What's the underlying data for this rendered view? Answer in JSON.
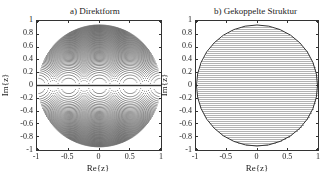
{
  "chart_data": [
    {
      "type": "scatter",
      "title": "a)  Direktform",
      "xlabel": "Re{z}",
      "ylabel": "Im{z}",
      "xlim": [
        -1,
        1
      ],
      "ylim": [
        -1,
        1
      ],
      "xticks": [
        "-1",
        "-0.5",
        "0",
        "0.5",
        "1"
      ],
      "yticks": [
        "1",
        "0.8",
        "0.6",
        "0.4",
        "0.2",
        "0",
        "-0.2",
        "-0.4",
        "-0.6",
        "-0.8",
        "-1"
      ],
      "description": "Realizable pole locations of a direct-form second-order section: points inside unit circle forming concentric arcs, dense near |z|=1 and sparse near z=±1, z=0 and along the real axis",
      "pattern": "direct_form",
      "grid": false
    },
    {
      "type": "scatter",
      "title": "b)  Gekoppelte Struktur",
      "xlabel": "Re{z}",
      "ylabel": "Im{z}",
      "xlim": [
        -1,
        1
      ],
      "ylim": [
        -1,
        1
      ],
      "xticks": [
        "-1",
        "-0.5",
        "0",
        "0.5",
        "1"
      ],
      "yticks": [
        "1",
        "0.8",
        "0.6",
        "0.4",
        "0.2",
        "0",
        "-0.2",
        "-0.4",
        "-0.6",
        "-0.8",
        "-1"
      ],
      "description": "Realizable pole locations of coupled-form structure: uniform rectangular grid of points inside unit circle",
      "pattern": "coupled_form",
      "grid": false
    }
  ],
  "panels": {
    "a": {
      "title": "a)  Direktform",
      "xlabel": "Re{z}",
      "ylabel": "Im{z}"
    },
    "b": {
      "title": "b)  Gekoppelte Struktur",
      "xlabel": "Re{z}",
      "ylabel": "Im{z}"
    }
  }
}
